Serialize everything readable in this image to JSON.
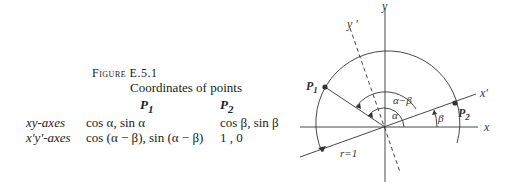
{
  "figure": {
    "label": "Figure E.5.1",
    "caption": "Coordinates of points"
  },
  "table": {
    "columns": [
      "P1",
      "P2"
    ],
    "column_main": [
      "P",
      "P"
    ],
    "column_sub": [
      "1",
      "2"
    ],
    "rows": [
      {
        "label": "xy-axes",
        "p1": "cos α, sin α",
        "p2": "cos β, sin β"
      },
      {
        "label": "x′y′-axes",
        "p1": "cos (α − β), sin (α − β)",
        "p2": "1   , 0"
      }
    ]
  },
  "diagram": {
    "axis_labels": {
      "x": "x",
      "y": "y",
      "x_prime": "x′",
      "y_prime": "y ′"
    },
    "points": [
      {
        "name": "P",
        "sub": "1"
      },
      {
        "name": "P",
        "sub": "2"
      }
    ],
    "angles": {
      "alpha_minus_beta": "α−β",
      "alpha": "α",
      "beta": "β"
    },
    "radius_label": "r=1"
  }
}
